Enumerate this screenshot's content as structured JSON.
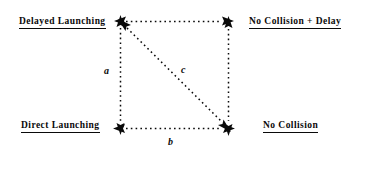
{
  "diagram": {
    "background_color": "#ffffff",
    "line_color": "#0a0a0a",
    "text_color": "#0a0a0a",
    "nodes": [
      {
        "id": "delayed-launching",
        "label": "Delayed  Launching",
        "position": "top-left",
        "underlined": true
      },
      {
        "id": "no-collision-delay",
        "label": "No  Collision  +  Delay",
        "position": "top-right",
        "underlined": true
      },
      {
        "id": "direct-launching",
        "label": "Direct  Launching",
        "position": "bottom-left",
        "underlined": true
      },
      {
        "id": "no-collision",
        "label": "No   Collision",
        "position": "bottom-right",
        "underlined": true
      }
    ],
    "edges": [
      {
        "id": "edge-top",
        "label": "",
        "from": "top-left",
        "to": "top-right",
        "style": "dashed",
        "arrows": "both"
      },
      {
        "id": "edge-left",
        "label": "a",
        "from": "top-left",
        "to": "bottom-left",
        "style": "dashed",
        "arrows": "both"
      },
      {
        "id": "edge-right",
        "label": "",
        "from": "top-right",
        "to": "bottom-right",
        "style": "dashed",
        "arrows": "both"
      },
      {
        "id": "edge-bottom",
        "label": "b",
        "from": "bottom-left",
        "to": "bottom-right",
        "style": "dashed",
        "arrows": "both"
      },
      {
        "id": "edge-diagonal",
        "label": "c",
        "from": "top-left",
        "to": "bottom-right",
        "style": "dashed",
        "arrows": "both"
      }
    ]
  }
}
